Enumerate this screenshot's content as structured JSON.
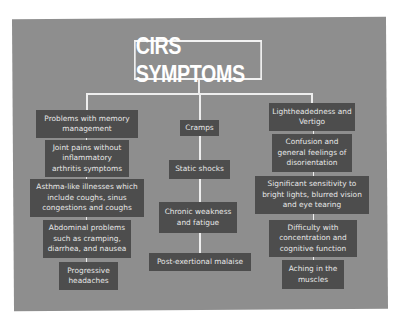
{
  "title": "CIRS SYMPTOMS",
  "colors": {
    "panel": "#8e8e8e",
    "node": "#4d4d4d",
    "text": "#e8e8e8",
    "line": "#eeeeee"
  },
  "columns": {
    "left": [
      "Problems with memory management",
      "Joint pains without inflammatory arthritis symptoms",
      "Asthma-like illnesses which include coughs, sinus congestions and coughs",
      "Abdominal problems such as cramping, diarrhea, and nausea",
      "Progressive headaches"
    ],
    "center": [
      "Cramps",
      "Static shocks",
      "Chronic weakness and fatigue",
      "Post-exertional malaise"
    ],
    "right": [
      "Lightheadedness and Vertigo",
      "Confusion and general feelings of disorientation",
      "Significant sensitivity to bright lights, blurred vision and eye tearing",
      "Difficulty with concentration and cognitive function",
      "Aching in the muscles"
    ]
  }
}
